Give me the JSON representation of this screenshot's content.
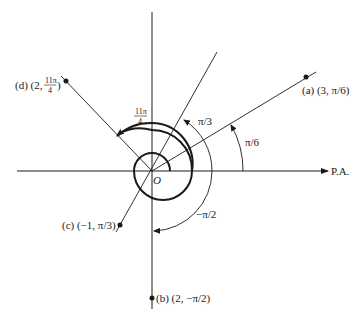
{
  "diagram": {
    "axis_label": "P.A.",
    "origin_label": "O",
    "points": [
      {
        "id": "a",
        "label": "(a) (3, π/6)",
        "r": 3,
        "theta": "π/6"
      },
      {
        "id": "b",
        "label": "(b) (2, −π/2)",
        "r": 2,
        "theta": "−π/2"
      },
      {
        "id": "c",
        "label": "(c) (−1, π/3)",
        "r": -1,
        "theta": "π/3"
      },
      {
        "id": "d",
        "label_prefix": "(d) (2, ",
        "label_frac_num": "11π",
        "label_frac_den": "4",
        "label_suffix": ")",
        "r": 2,
        "theta": "11π/4"
      }
    ],
    "angle_labels": {
      "pi_over_6": "π/6",
      "pi_over_3": "π/3",
      "neg_pi_over_2": "−π/2",
      "eleven_pi_over_4_num": "11π",
      "eleven_pi_over_4_den": "4"
    },
    "colors": {
      "line": "#1a1a1a",
      "background": "#ffffff"
    }
  }
}
